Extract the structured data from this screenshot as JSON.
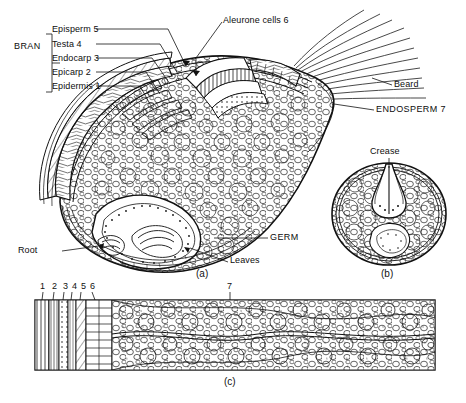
{
  "figure": {
    "title_none": "",
    "panels": [
      {
        "id": "a",
        "letter": "(a)",
        "caption": "longitudinal section of wheat kernel"
      },
      {
        "id": "b",
        "letter": "(b)",
        "caption": "cross section of wheat kernel"
      },
      {
        "id": "c",
        "letter": "(c)",
        "caption": "magnified bran layers"
      }
    ],
    "labels": {
      "bran": "BRAN",
      "episperm": "Episperm 5",
      "testa": "Testa 4",
      "endocarp": "Endocarp 3",
      "epicarp": "Epicarp 2",
      "epidermis": "Epidermis 1",
      "aleurone": "Aleurone cells 6",
      "beard": "Beard",
      "endosperm": "ENDOSPERM 7",
      "crease": "Crease",
      "root": "Root",
      "germ": "GERM",
      "leaves": "Leaves"
    },
    "panel_c_numbers": [
      "1",
      "2",
      "3",
      "4",
      "5",
      "6",
      "7"
    ],
    "colors": {
      "ink": "#111111",
      "paper": "#ffffff",
      "shade": "#d8d8d8",
      "mid": "#bbbbbb"
    }
  }
}
